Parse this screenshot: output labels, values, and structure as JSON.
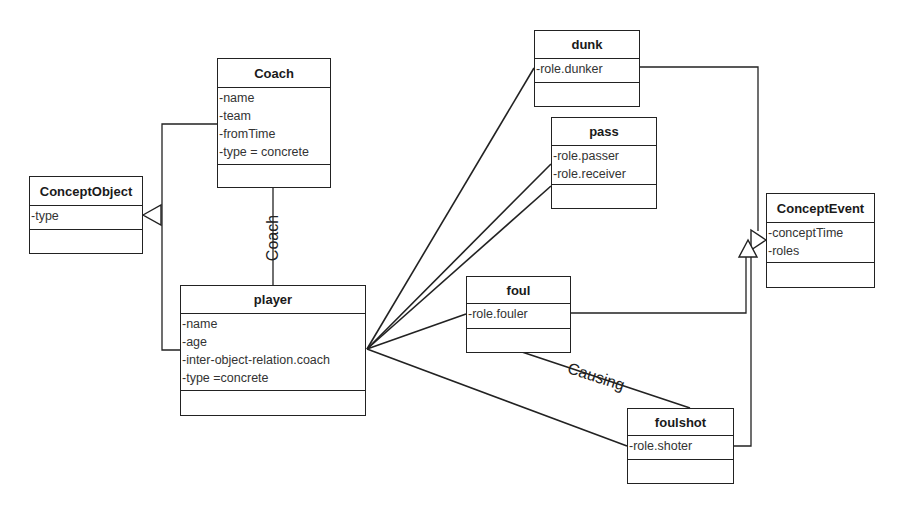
{
  "diagram_type": "UML class diagram",
  "classes": {
    "coach": {
      "name": "Coach",
      "attributes": [
        "-name",
        "-team",
        "-fromTime",
        "-type = concrete"
      ]
    },
    "concept_object": {
      "name": "ConceptObject",
      "attributes": [
        "-type"
      ]
    },
    "player": {
      "name": "player",
      "attributes": [
        "-name",
        "-age",
        "-inter-object-relation.coach",
        "-type =concrete"
      ]
    },
    "dunk": {
      "name": "dunk",
      "attributes": [
        "-role.dunker"
      ]
    },
    "pass": {
      "name": "pass",
      "attributes": [
        "-role.passer",
        "-role.receiver"
      ]
    },
    "foul": {
      "name": "foul",
      "attributes": [
        "-role.fouler"
      ]
    },
    "foulshot": {
      "name": "foulshot",
      "attributes": [
        "-role.shoter"
      ]
    },
    "concept_event": {
      "name": "ConceptEvent",
      "attributes": [
        "-conceptTime",
        "-roles"
      ]
    }
  },
  "relations": {
    "coach_player": {
      "type": "association",
      "from": "Coach",
      "to": "player",
      "label": "Coach"
    },
    "foul_foulshot": {
      "type": "association",
      "from": "foul",
      "to": "foulshot",
      "label": "Causing"
    },
    "generalizations": [
      {
        "child": "Coach",
        "parent": "ConceptObject"
      },
      {
        "child": "player",
        "parent": "ConceptObject"
      },
      {
        "child": "dunk",
        "parent": "ConceptEvent"
      },
      {
        "child": "foul",
        "parent": "ConceptEvent"
      },
      {
        "child": "foulshot",
        "parent": "ConceptEvent"
      }
    ],
    "player_roles": [
      {
        "to": "dunk",
        "attribute": "-role.dunker"
      },
      {
        "to": "pass",
        "attribute": "-role.passer"
      },
      {
        "to": "pass",
        "attribute": "-role.receiver"
      },
      {
        "to": "foul",
        "attribute": "-role.fouler"
      },
      {
        "to": "foulshot",
        "attribute": "-role.shoter"
      }
    ]
  }
}
